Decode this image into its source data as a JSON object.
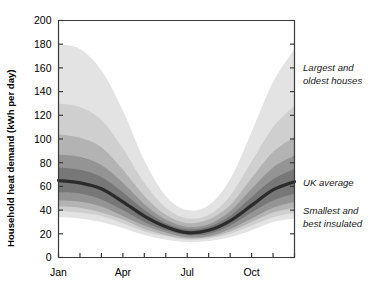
{
  "chart_data": {
    "type": "area",
    "title": "",
    "xlabel": "",
    "ylabel": "Household heat demand (kWh per day)",
    "ylim": [
      0,
      200
    ],
    "yticks": [
      0,
      20,
      40,
      60,
      80,
      100,
      120,
      140,
      160,
      180,
      200
    ],
    "ytick_labels": [
      "0",
      "20",
      "40",
      "60",
      "80",
      "100",
      "120",
      "140",
      "160",
      "180",
      "200"
    ],
    "x": [
      "Jan",
      "Feb",
      "Mar",
      "Apr",
      "May",
      "Jun",
      "Jul",
      "Aug",
      "Sep",
      "Oct",
      "Nov",
      "Dec"
    ],
    "xtick_labels": [
      "Jan",
      "Apr",
      "Jul",
      "Oct"
    ],
    "xtick_label_positions": [
      0,
      3,
      6,
      9
    ],
    "xlim": [
      0,
      11
    ],
    "grid": false,
    "legend": "right-side annotations",
    "series": [
      {
        "name": "Largest and oldest houses",
        "role": "upper-outer-envelope",
        "color": "#e3e3e3",
        "values": [
          180,
          176,
          158,
          124,
          82,
          52,
          40,
          44,
          66,
          106,
          148,
          176
        ]
      },
      {
        "name": "Upper band 2",
        "role": "upper-band",
        "color": "#cfcfcf",
        "values": [
          130,
          127,
          116,
          92,
          63,
          42,
          33,
          36,
          52,
          81,
          110,
          128
        ]
      },
      {
        "name": "Upper band 3",
        "role": "upper-band",
        "color": "#b3b3b3",
        "values": [
          104,
          101,
          93,
          74,
          52,
          36,
          29,
          32,
          44,
          67,
          89,
          102
        ]
      },
      {
        "name": "Upper band 4",
        "role": "upper-band",
        "color": "#949494",
        "values": [
          87,
          85,
          78,
          63,
          45,
          32,
          26,
          28,
          39,
          58,
          76,
          86
        ]
      },
      {
        "name": "Upper band 5",
        "role": "upper-band",
        "color": "#777777",
        "values": [
          76,
          74,
          68,
          55,
          40,
          29,
          24,
          26,
          35,
          51,
          66,
          75
        ]
      },
      {
        "name": "UK average",
        "role": "median-line",
        "color": "#2b2b2b",
        "values": [
          65,
          63,
          58,
          47,
          35,
          26,
          21,
          23,
          31,
          44,
          57,
          64
        ]
      },
      {
        "name": "Lower band 5",
        "role": "lower-band",
        "color": "#777777",
        "values": [
          55,
          54,
          49,
          40,
          30,
          23,
          19,
          20,
          27,
          38,
          48,
          54
        ]
      },
      {
        "name": "Lower band 4",
        "role": "lower-band",
        "color": "#949494",
        "values": [
          48,
          47,
          43,
          35,
          27,
          21,
          17,
          18,
          24,
          33,
          42,
          47
        ]
      },
      {
        "name": "Lower band 3",
        "role": "lower-band",
        "color": "#b3b3b3",
        "values": [
          43,
          42,
          38,
          32,
          24,
          19,
          16,
          17,
          22,
          30,
          38,
          42
        ]
      },
      {
        "name": "Lower band 2",
        "role": "lower-band",
        "color": "#cfcfcf",
        "values": [
          39,
          38,
          35,
          29,
          22,
          18,
          15,
          16,
          20,
          27,
          34,
          38
        ]
      },
      {
        "name": "Smallest and best insulated",
        "role": "lower-outer-envelope",
        "color": "#e3e3e3",
        "values": [
          34,
          33,
          30,
          25,
          19,
          15,
          13,
          14,
          17,
          23,
          30,
          33
        ]
      }
    ]
  },
  "axis": {
    "y_title": "Household heat demand (kWh per day)"
  },
  "annotations": [
    {
      "id": "largest-oldest",
      "line1": "Largest and",
      "line2": "oldest houses"
    },
    {
      "id": "uk-average",
      "line1": "UK average",
      "line2": ""
    },
    {
      "id": "smallest-insulated",
      "line1": "Smallest and",
      "line2": "best insulated"
    }
  ],
  "colors": {
    "axis": "#3a3a3a",
    "text": "#000000",
    "median": "#2b2b2b",
    "background": "#ffffff"
  }
}
